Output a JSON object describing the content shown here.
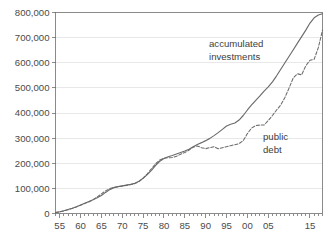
{
  "chart_data": {
    "type": "line",
    "title": "",
    "subtitle": "",
    "xlabel": "",
    "ylabel": "",
    "grid": "horizontal",
    "legend_position": "inline-annotations",
    "ylim": [
      0,
      800000
    ],
    "ytick_labels": [
      "0",
      "100,000",
      "200,000",
      "300,000",
      "400,000",
      "500,000",
      "600,000",
      "700,000",
      "800,000"
    ],
    "ytick_values": [
      0,
      100000,
      200000,
      300000,
      400000,
      500000,
      600000,
      700000,
      800000
    ],
    "xlim": [
      1954,
      2018
    ],
    "xtick_labels": [
      "55",
      "60",
      "65",
      "70",
      "75",
      "80",
      "85",
      "90",
      "95",
      "00",
      "05",
      "15"
    ],
    "xtick_values": [
      1955,
      1960,
      1965,
      1970,
      1975,
      1980,
      1985,
      1990,
      1995,
      2000,
      2005,
      2015
    ],
    "x": [
      1954,
      1955,
      1956,
      1957,
      1958,
      1959,
      1960,
      1961,
      1962,
      1963,
      1964,
      1965,
      1966,
      1967,
      1968,
      1969,
      1970,
      1971,
      1972,
      1973,
      1974,
      1975,
      1976,
      1977,
      1978,
      1979,
      1980,
      1981,
      1982,
      1983,
      1984,
      1985,
      1986,
      1987,
      1988,
      1989,
      1990,
      1991,
      1992,
      1993,
      1994,
      1995,
      1996,
      1997,
      1998,
      1999,
      2000,
      2001,
      2002,
      2003,
      2004,
      2005,
      2006,
      2007,
      2008,
      2009,
      2010,
      2011,
      2012,
      2013,
      2014,
      2015,
      2016,
      2017,
      2018
    ],
    "series": [
      {
        "name": "accumulated investments",
        "style": "solid",
        "color": "#6b6b6b",
        "annotation": "accumulated\ninvestments",
        "values": [
          4000,
          7000,
          11000,
          16000,
          21000,
          27000,
          34000,
          41000,
          48000,
          55000,
          63000,
          72000,
          84000,
          95000,
          103000,
          107000,
          110000,
          113000,
          116000,
          120000,
          128000,
          140000,
          155000,
          172000,
          192000,
          208000,
          219000,
          226000,
          231000,
          237000,
          243000,
          249000,
          256000,
          266000,
          275000,
          282000,
          290000,
          299000,
          310000,
          322000,
          335000,
          348000,
          355000,
          360000,
          372000,
          390000,
          412000,
          432000,
          450000,
          468000,
          487000,
          504000,
          524000,
          548000,
          574000,
          600000,
          626000,
          652000,
          678000,
          704000,
          730000,
          758000,
          779000,
          790000,
          795000
        ]
      },
      {
        "name": "public debt",
        "style": "dashed",
        "color": "#6b6b6b",
        "annotation": "public\ndebt",
        "values": [
          4000,
          6000,
          10000,
          15000,
          20000,
          26000,
          33000,
          40000,
          46000,
          55000,
          66000,
          78000,
          90000,
          99000,
          104000,
          107000,
          109000,
          112000,
          115000,
          119000,
          127000,
          141000,
          158000,
          178000,
          198000,
          213000,
          220000,
          222000,
          223000,
          228000,
          236000,
          243000,
          252000,
          264000,
          269000,
          262000,
          258000,
          262000,
          266000,
          258000,
          262000,
          266000,
          270000,
          274000,
          278000,
          290000,
          318000,
          340000,
          350000,
          352000,
          352000,
          370000,
          390000,
          412000,
          432000,
          462000,
          500000,
          540000,
          556000,
          552000,
          588000,
          610000,
          614000,
          660000,
          730000
        ]
      }
    ],
    "annotations": [
      {
        "id": "accumulated-investments-label",
        "line1": "accumulated",
        "line2": "investments"
      },
      {
        "id": "public-debt-label",
        "line1": "public",
        "line2": "debt"
      }
    ]
  }
}
